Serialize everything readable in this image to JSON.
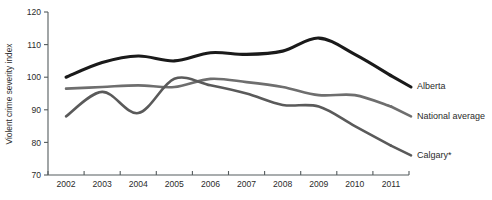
{
  "chart_data": {
    "type": "line",
    "title": "",
    "xlabel": "",
    "ylabel": "Violent crime severity index",
    "categories": [
      "2002",
      "2003",
      "2004",
      "2005",
      "2006",
      "2007",
      "2008",
      "2009",
      "2010",
      "2011"
    ],
    "x": [
      2002,
      2003,
      2004,
      2005,
      2006,
      2007,
      2008,
      2009,
      2010,
      2011
    ],
    "xlim": [
      2002,
      2011
    ],
    "ylim": [
      70,
      120
    ],
    "yticks": [
      70,
      80,
      90,
      100,
      110,
      120
    ],
    "ytick_labels": [
      "70",
      "80",
      "90",
      "100",
      "110",
      "120"
    ],
    "grid": false,
    "legend_position": "right-inline-end-of-line",
    "series": [
      {
        "name": "Alberta",
        "color": "#1a1a1a",
        "width": 3.1,
        "values": [
          100.0,
          104.5,
          106.5,
          105.0,
          107.5,
          107.0,
          108.0,
          112.0,
          107.0,
          100.5
        ],
        "end_label_value": 97.0
      },
      {
        "name": "National average",
        "color": "#6e6e6e",
        "width": 2.6,
        "values": [
          96.5,
          97.0,
          97.5,
          97.0,
          99.5,
          98.5,
          97.0,
          94.5,
          94.5,
          91.0
        ],
        "end_label_value": 88.0
      },
      {
        "name": "Calgary*",
        "color": "#5a5a5a",
        "width": 2.6,
        "values": [
          88.0,
          95.5,
          89.0,
          99.5,
          97.5,
          95.0,
          91.5,
          91.0,
          85.0,
          79.0
        ],
        "end_label_value": 76.0
      }
    ]
  },
  "axis": {
    "y_title": "Violent crime severity index"
  },
  "legend": {
    "items": [
      {
        "label": "Alberta"
      },
      {
        "label": "National average"
      },
      {
        "label": "Calgary*"
      }
    ]
  }
}
